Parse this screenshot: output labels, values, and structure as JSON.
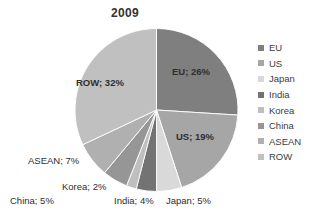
{
  "chart_data": {
    "type": "pie",
    "title": "2009",
    "xlabel": "",
    "ylabel": "",
    "legend_position": "right",
    "grid": false,
    "categories": [
      "EU",
      "US",
      "Japan",
      "India",
      "Korea",
      "China",
      "ASEAN",
      "ROW"
    ],
    "values": [
      26,
      19,
      5,
      4,
      2,
      5,
      7,
      32
    ],
    "value_unit": "%",
    "slice_colors": [
      "#7f7f7f",
      "#a6a6a6",
      "#d9d9d9",
      "#737373",
      "#bfbfbf",
      "#969696",
      "#b0b0b0",
      "#c0c0c0"
    ],
    "data_labels": [
      "EU; 26%",
      "US; 19%",
      "Japan; 5%",
      "India; 4%",
      "Korea; 2%",
      "China; 5%",
      "ASEAN; 7%",
      "ROW; 32%"
    ]
  },
  "legend": {
    "items": [
      {
        "label": "EU",
        "color": "#7f7f7f"
      },
      {
        "label": "US",
        "color": "#a6a6a6"
      },
      {
        "label": "Japan",
        "color": "#d9d9d9"
      },
      {
        "label": "India",
        "color": "#737373"
      },
      {
        "label": "Korea",
        "color": "#bfbfbf"
      },
      {
        "label": "China",
        "color": "#969696"
      },
      {
        "label": "ASEAN",
        "color": "#b0b0b0"
      },
      {
        "label": "ROW",
        "color": "#c0c0c0"
      }
    ]
  },
  "labels": {
    "eu": "EU; 26%",
    "us": "US; 19%",
    "row": "ROW; 32%",
    "asean": "ASEAN; 7%",
    "korea": "Korea; 2%",
    "china": "China; 5%",
    "india": "India; 4%",
    "japan": "Japan; 5%"
  },
  "colors": {
    "background": "#ffffff",
    "text": "#3b3b3b",
    "title": "#333333"
  }
}
